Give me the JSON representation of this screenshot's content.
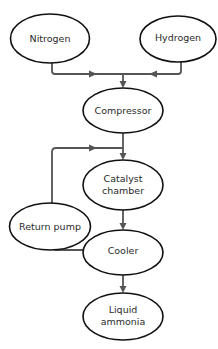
{
  "diagram": {
    "type": "flowchart",
    "title": "",
    "colors": {
      "node_stroke": "#111111",
      "edge": "#555555",
      "text": "#2a2a2a",
      "background": "#ffffff"
    },
    "nodes": {
      "nitrogen": {
        "label": "Nitrogen"
      },
      "hydrogen": {
        "label": "Hydrogen"
      },
      "compressor": {
        "label": "Compressor"
      },
      "catalyst": {
        "label_line1": "Catalyst",
        "label_line2": "chamber"
      },
      "return_pump": {
        "label": "Return pump"
      },
      "cooler": {
        "label": "Cooler"
      },
      "ammonia": {
        "label_line1": "Liquid",
        "label_line2": "ammonia"
      }
    },
    "edges": [
      {
        "from": "Nitrogen",
        "to": "Compressor"
      },
      {
        "from": "Hydrogen",
        "to": "Compressor"
      },
      {
        "from": "Compressor",
        "to": "Catalyst chamber"
      },
      {
        "from": "Catalyst chamber",
        "to": "Cooler"
      },
      {
        "from": "Cooler",
        "to": "Return pump"
      },
      {
        "from": "Return pump",
        "to": "Catalyst chamber"
      },
      {
        "from": "Cooler",
        "to": "Liquid ammonia"
      }
    ]
  }
}
